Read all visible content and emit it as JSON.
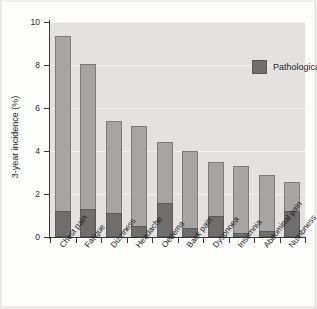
{
  "figure": {
    "background_color": "#fdfdfc",
    "plot_background_color": "#e3e2e0"
  },
  "chart_data": {
    "type": "bar",
    "subtype": "stacked",
    "title": "",
    "xlabel": "",
    "ylabel": "3-year incidence (%)",
    "ylim": [
      0,
      10
    ],
    "yticks": [
      0,
      2,
      4,
      6,
      8,
      10
    ],
    "ytick_labels": [
      "0",
      "2",
      "4",
      "6",
      "8",
      "10"
    ],
    "grid": true,
    "legend_position": "top-right",
    "categories": [
      "Chest pain",
      "Fatigue",
      "Dizziness",
      "Headache",
      "Oedema",
      "Back pain",
      "Dyspnoea",
      "Insomnia",
      "Abdominal pain",
      "Numbness"
    ],
    "series": [
      {
        "name": "Pathological cause",
        "color": "#6f6e6c",
        "values": [
          1.2,
          1.3,
          1.1,
          0.5,
          1.6,
          0.4,
          1.0,
          0.2,
          0.3,
          1.2
        ]
      },
      {
        "name": "Total incidence",
        "color": "#a6a5a3",
        "values": [
          9.35,
          8.05,
          5.4,
          5.15,
          4.4,
          4.0,
          3.5,
          3.3,
          2.9,
          2.55
        ]
      }
    ]
  },
  "legend": {
    "entries": [
      {
        "label": "Pathological cause",
        "color": "#6f6e6c"
      }
    ]
  }
}
